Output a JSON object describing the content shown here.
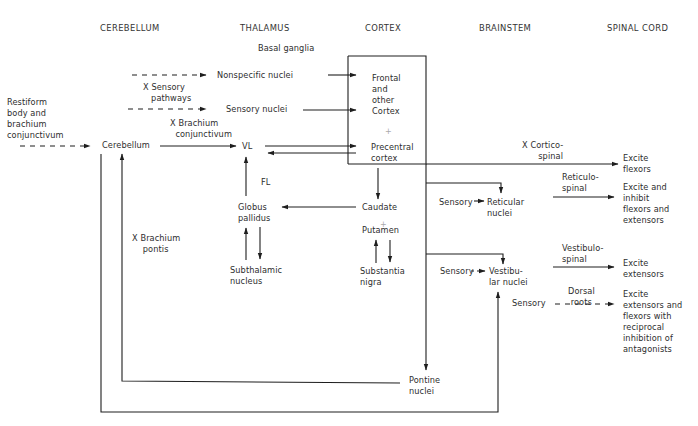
{
  "headers": {
    "cerebellum": "CEREBELLUM",
    "thalamus": "THALAMUS",
    "cortex": "CORTEX",
    "brainstem": "BRAINSTEM",
    "spinal_cord": "SPINAL CORD"
  },
  "nodes": {
    "basal_ganglia": "Basal ganglia",
    "restiform": "Restiform\nbody and\nbrachium\nconjunctivum",
    "cerebellum": "Cerebellum",
    "nonspecific_nuclei": "Nonspecific nuclei",
    "sensory_nuclei": "Sensory nuclei",
    "vl": "VL",
    "frontal_cortex": "Frontal\nand\nother\nCortex",
    "precentral_cortex": "Precentral\ncortex",
    "globus_pallidus": "Globus\npallidus",
    "subthalamic_nucleus": "Subthalamic\nnucleus",
    "caudate": "Caudate",
    "putamen": "Putamen",
    "substantia_nigra": "Substantia\nnigra",
    "reticular_nuclei": "Reticular\nnuclei",
    "vestibular_nuclei": "Vestibu-\nlar nuclei",
    "pontine_nuclei": "Pontine\nnuclei",
    "sensory_reticular": "Sensory",
    "sensory_vestibular": "Sensory",
    "sensory_dorsal": "Sensory",
    "excite_flexors": "Excite\nflexors",
    "excite_inhibit": "Excite and\ninhibit\nflexors and\nextensors",
    "excite_extensors": "Excite\nextensors",
    "excite_reciprocal": "Excite\nextensors and\nflexors with\nreciprocal\ninhibition of\nantagonists",
    "plus_symbol": "+"
  },
  "pathway_labels": {
    "x_sensory_pathways": "X Sensory\n   pathways",
    "x_brachium_conjunctivum": "X Brachium\n  conjunctivum",
    "fl": "FL",
    "x_brachium_pontis": "X Brachium\n    pontis",
    "x_corticospinal": "X Cortico-\n      spinal",
    "reticulospinal": "Reticulo-\nspinal",
    "vestibulospinal": "Vestibulo-\nspinal",
    "dorsal_roots": "Dorsal\n roots"
  },
  "colors": {
    "line": "#1e1e1e",
    "text": "#2e2e2e",
    "background": "#ffffff"
  }
}
